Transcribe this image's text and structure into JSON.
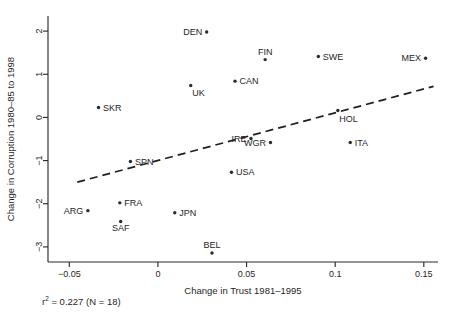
{
  "chart_data": {
    "type": "scatter",
    "title": "",
    "xlabel": "Change in Trust 1981–1995",
    "ylabel": "Change in Corruption 1980–85 to 1998",
    "xlim": [
      -0.062,
      0.158
    ],
    "ylim": [
      -3.35,
      2.35
    ],
    "xticks": [
      -0.05,
      0,
      0.05,
      0.1,
      0.15
    ],
    "xticklabels": [
      "−0.05",
      "0",
      "0.05",
      "0.1",
      "0.15"
    ],
    "yticks": [
      -3,
      -2,
      -1,
      0,
      1,
      2
    ],
    "yticklabels": [
      "−3",
      "−2",
      "−1",
      "0",
      "1",
      "2"
    ],
    "grid": false,
    "legend": null,
    "points": [
      {
        "label": "DEN",
        "x": 0.0275,
        "y": 1.98,
        "label_side": "left"
      },
      {
        "label": "FIN",
        "x": 0.0605,
        "y": 1.34,
        "label_side": "above"
      },
      {
        "label": "SWE",
        "x": 0.0905,
        "y": 1.41,
        "label_side": "right"
      },
      {
        "label": "MEX",
        "x": 0.151,
        "y": 1.37,
        "label_side": "left"
      },
      {
        "label": "CAN",
        "x": 0.0435,
        "y": 0.84,
        "label_side": "right"
      },
      {
        "label": "UK",
        "x": 0.0185,
        "y": 0.74,
        "label_side": "below-right"
      },
      {
        "label": "SKR",
        "x": -0.0335,
        "y": 0.23,
        "label_side": "right"
      },
      {
        "label": "HOL",
        "x": 0.1015,
        "y": 0.16,
        "label_side": "below-right"
      },
      {
        "label": "IRE",
        "x": 0.0525,
        "y": -0.49,
        "label_side": "left"
      },
      {
        "label": "WGR",
        "x": 0.0635,
        "y": -0.58,
        "label_side": "left"
      },
      {
        "label": "ITA",
        "x": 0.1085,
        "y": -0.58,
        "label_side": "right"
      },
      {
        "label": "SPN",
        "x": -0.0155,
        "y": -1.02,
        "label_side": "right"
      },
      {
        "label": "USA",
        "x": 0.0415,
        "y": -1.27,
        "label_side": "right"
      },
      {
        "label": "FRA",
        "x": -0.0215,
        "y": -1.98,
        "label_side": "right"
      },
      {
        "label": "ARG",
        "x": -0.0395,
        "y": -2.16,
        "label_side": "left"
      },
      {
        "label": "JPN",
        "x": 0.0095,
        "y": -2.21,
        "label_side": "right"
      },
      {
        "label": "SAF",
        "x": -0.021,
        "y": -2.41,
        "label_side": "below"
      },
      {
        "label": "BEL",
        "x": 0.0305,
        "y": -3.14,
        "label_side": "above"
      }
    ],
    "trendline": {
      "x_start": -0.0455,
      "y_start": -1.5,
      "x_end": 0.1555,
      "y_end": 0.72,
      "style": "dashed"
    },
    "annotations": {
      "r_squared_prefix": "r",
      "r_squared_exponent": "2",
      "r_squared_text": " = 0.227  (N = 18)"
    }
  }
}
